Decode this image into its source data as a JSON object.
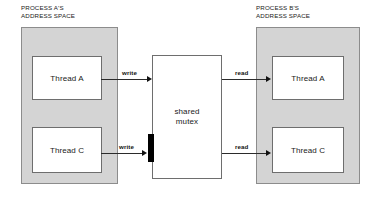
{
  "diagram": {
    "background_color": "#ffffff",
    "process_fill_color": "#d4d4d4",
    "box_fill_color": "#ffffff",
    "lock_color": "#000000"
  },
  "processes": [
    {
      "id": "process-a",
      "caption": "PROCESS A'S\nADDRESS SPACE",
      "threads": [
        {
          "id": "process-a-thread-a",
          "label": "Thread A"
        },
        {
          "id": "process-a-thread-c",
          "label": "Thread C"
        }
      ]
    },
    {
      "id": "process-b",
      "caption": "PROCESS B'S\nADDRESS SPACE",
      "threads": [
        {
          "id": "process-b-thread-a",
          "label": "Thread A"
        },
        {
          "id": "process-b-thread-c",
          "label": "Thread C"
        }
      ]
    }
  ],
  "shared_resource": {
    "id": "shared-mutex",
    "label": "shared\nmutex"
  },
  "connections": [
    {
      "id": "write-thread-a",
      "label": "write",
      "direction": "to-mutex",
      "locked": false
    },
    {
      "id": "write-thread-c",
      "label": "write",
      "direction": "to-mutex",
      "locked": true
    },
    {
      "id": "read-thread-a",
      "label": "read",
      "direction": "from-mutex",
      "locked": false
    },
    {
      "id": "read-thread-c",
      "label": "read",
      "direction": "from-mutex",
      "locked": false
    }
  ]
}
